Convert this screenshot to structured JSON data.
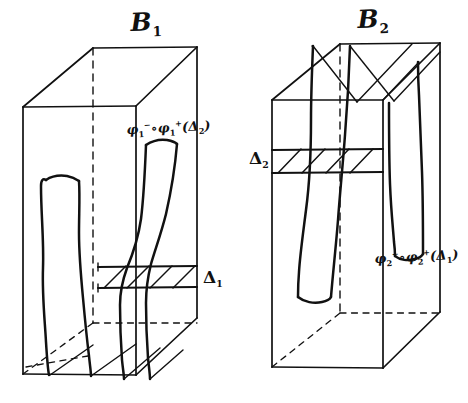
{
  "figure": {
    "kind": "hand-drawn-mathematical-diagram",
    "background_color": "#ffffff",
    "ink_color": "#111111"
  },
  "boxes": [
    {
      "id": "box-1",
      "title": "B",
      "title_subscript": "1",
      "slab_label": "Δ",
      "slab_label_subscript": "1",
      "tube_label_prefix": "φ",
      "tube_label": "φ₁⁻∘φ₁⁺(Δ₂)",
      "tube_label_parts": {
        "phi": "φ",
        "sub_a": "1",
        "sup_a": "−",
        "compose": "∘",
        "sub_b": "1",
        "sup_b": "+",
        "open": "(",
        "arg": "Δ",
        "arg_sub": "2",
        "close": ")"
      }
    },
    {
      "id": "box-2",
      "title": "B",
      "title_subscript": "2",
      "slab_label": "Δ",
      "slab_label_subscript": "2",
      "tube_label_prefix": "φ",
      "tube_label": "φ₂⁻∘φ₂⁺(Δ₁)",
      "tube_label_parts": {
        "phi": "φ",
        "sub_a": "2",
        "sup_a": "−",
        "compose": "∘",
        "sub_b": "2",
        "sup_b": "+",
        "open": "(",
        "arg": "Δ",
        "arg_sub": "1",
        "close": ")"
      }
    }
  ],
  "labels": {
    "b1_title": "B",
    "b1_sub": "1",
    "b2_title": "B",
    "b2_sub": "2",
    "delta1": "Δ",
    "delta1_sub": "1",
    "delta2": "Δ",
    "delta2_sub": "2",
    "phi": "φ",
    "compose": "∘",
    "minus": "−",
    "plus": "+",
    "paren_open": "(",
    "paren_close": ")",
    "one": "1",
    "two": "2",
    "delta": "Δ"
  }
}
